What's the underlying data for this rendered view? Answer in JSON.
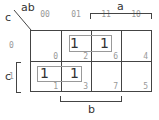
{
  "kmap": {
    "corner": {
      "row_var": "c",
      "col_vars": "ab"
    },
    "columns": [
      "00",
      "01",
      "11",
      "10"
    ],
    "rows": [
      "0",
      "1"
    ],
    "cells": [
      [
        {
          "value": "",
          "minterm": "0"
        },
        {
          "value": "1",
          "minterm": "2"
        },
        {
          "value": "1",
          "minterm": "6"
        },
        {
          "value": "",
          "minterm": "4"
        }
      ],
      [
        {
          "value": "1",
          "minterm": "1"
        },
        {
          "value": "1",
          "minterm": "3"
        },
        {
          "value": "",
          "minterm": "7"
        },
        {
          "value": "",
          "minterm": "5"
        }
      ]
    ],
    "brackets": {
      "a": "a",
      "b": "b",
      "c": "c"
    },
    "groups": [
      {
        "cells": [
          "2",
          "6"
        ]
      },
      {
        "cells": [
          "1",
          "3"
        ]
      }
    ]
  }
}
